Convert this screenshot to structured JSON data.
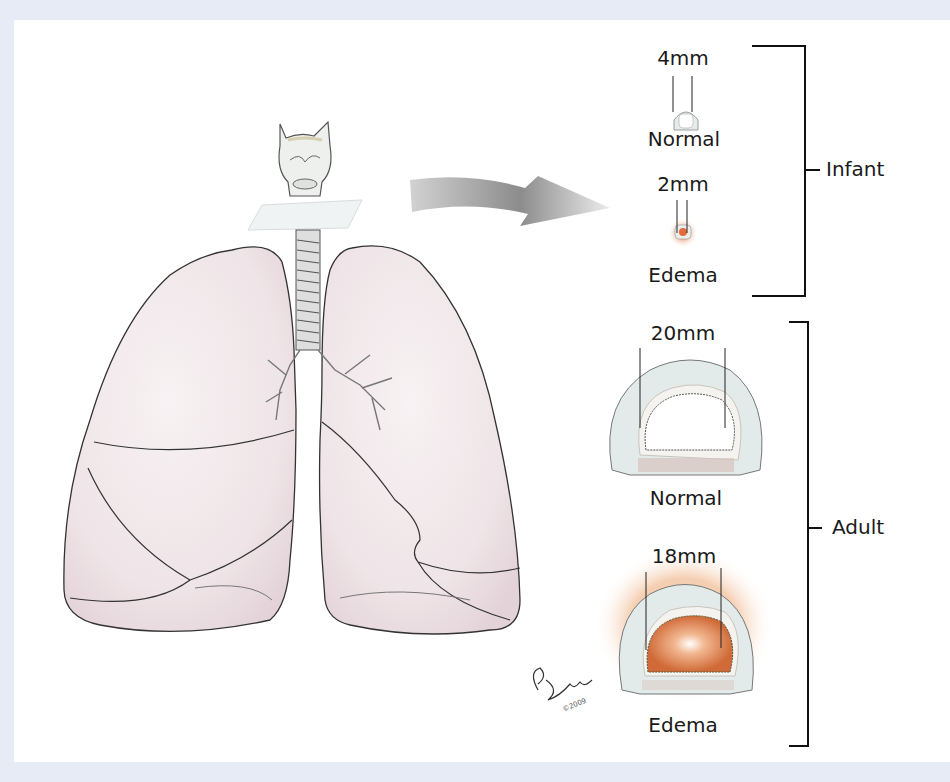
{
  "figure": {
    "colors": {
      "background": "#e6ebf5",
      "panel": "#ffffff",
      "lung_fill": "#f1e8ea",
      "lung_stroke": "#3a3a3a",
      "cartilage": "#e3eaea",
      "edema": "#d9733f",
      "arrow": "#9a9a9a",
      "bracket": "#111111"
    },
    "illustration": {
      "subject": "lungs-with-trachea-and-larynx",
      "cross_section_plane": "subglottic-plane",
      "arrow_direction": "right"
    },
    "groups": [
      {
        "name": "Infant",
        "items": [
          {
            "state": "Normal",
            "diameter": "4mm"
          },
          {
            "state": "Edema",
            "diameter": "2mm"
          }
        ]
      },
      {
        "name": "Adult",
        "items": [
          {
            "state": "Normal",
            "diameter": "20mm"
          },
          {
            "state": "Edema",
            "diameter": "18mm"
          }
        ]
      }
    ],
    "signature": {
      "text": "Ebee",
      "copyright": "©2009"
    }
  }
}
